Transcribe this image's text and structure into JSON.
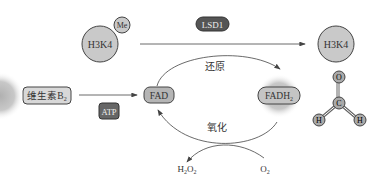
{
  "diagram": {
    "h3k4_left": {
      "label": "H3K4",
      "modifier": "Me"
    },
    "enzyme": {
      "label": "LSD1"
    },
    "h3k4_right": {
      "label": "H3K4"
    },
    "vitamin": {
      "label_main": "维生素B",
      "label_sub": "2"
    },
    "atp": {
      "label": "ATP"
    },
    "fad": {
      "label": "FAD"
    },
    "fadh2": {
      "label_main": "FADH",
      "label_sub": "2"
    },
    "reduction": {
      "label": "还原"
    },
    "oxidation": {
      "label": "氧化"
    },
    "h2o2": {
      "label": "H2O2",
      "parts": [
        "H",
        "2",
        "O",
        "2"
      ]
    },
    "o2": {
      "label": "O2",
      "parts": [
        "O",
        "2"
      ]
    },
    "formaldehyde": {
      "atoms": {
        "o": "O",
        "c": "C",
        "h_left": "H",
        "h_right": "H"
      }
    },
    "colors": {
      "circle_fill": "#c9c9c9",
      "dark_box": "#555555",
      "light_box": "#d8d8d8",
      "stroke": "#444444"
    }
  }
}
